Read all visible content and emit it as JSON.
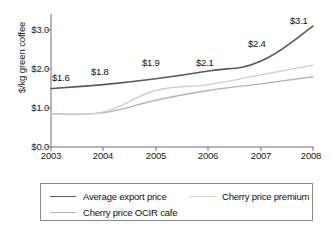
{
  "chart_data": {
    "type": "line",
    "title": "",
    "xlabel": "",
    "ylabel": "$/kg green coffee",
    "x": [
      2003,
      2004,
      2005,
      2006,
      2007,
      2008
    ],
    "xtick_labels": [
      "2003",
      "2004",
      "2005",
      "2006",
      "2007",
      "2008"
    ],
    "ytick_labels": [
      "$0.0",
      "$1.0",
      "$2.0",
      "$3.0"
    ],
    "ytick_values": [
      0.0,
      1.0,
      2.0,
      3.0
    ],
    "ylim": [
      0.0,
      3.4
    ],
    "xlim": [
      2003,
      2008
    ],
    "grid": false,
    "legend_position": "below-plot",
    "series": [
      {
        "name": "Average export price",
        "color": "#5a5a5a",
        "width": 1.6,
        "values": [
          1.5,
          1.6,
          1.75,
          1.95,
          2.2,
          3.1
        ]
      },
      {
        "name": "Cherry price premium",
        "color": "#cfcfcf",
        "width": 1.4,
        "values": [
          0.85,
          0.9,
          1.45,
          1.6,
          1.85,
          2.1
        ]
      },
      {
        "name": "Cherry price OCIR cafe",
        "color": "#b3b3b3",
        "width": 1.4,
        "values": [
          0.85,
          0.88,
          1.2,
          1.45,
          1.62,
          1.8
        ]
      }
    ],
    "annotations": [
      {
        "text": "$1.6",
        "x": 2003,
        "y": 1.5
      },
      {
        "text": "$1.8",
        "x": 2004,
        "y": 1.6
      },
      {
        "text": "$1.9",
        "x": 2005,
        "y": 1.75
      },
      {
        "text": "$2.1",
        "x": 2006,
        "y": 1.95
      },
      {
        "text": "$2.4",
        "x": 2007,
        "y": 2.2
      },
      {
        "text": "$3.1",
        "x": 2008,
        "y": 3.1
      }
    ]
  },
  "legend": {
    "items": [
      {
        "label": "Average export price",
        "color": "#5a5a5a"
      },
      {
        "label": "Cherry price premium",
        "color": "#cfcfcf"
      },
      {
        "label": "Cherry price OCIR cafe",
        "color": "#b3b3b3"
      }
    ]
  }
}
